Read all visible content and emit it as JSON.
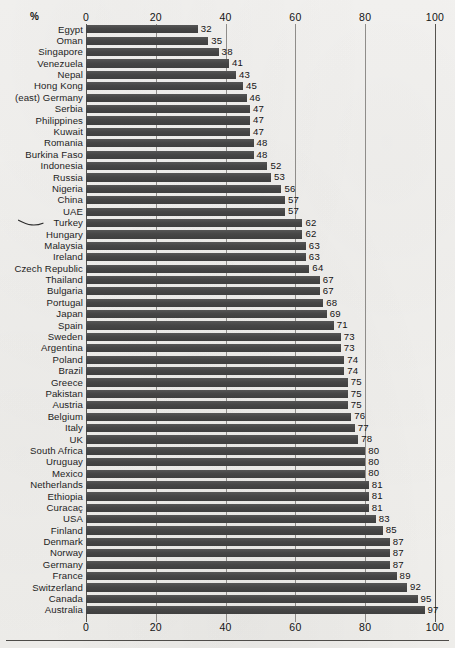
{
  "units_label": "%",
  "annotation": {
    "name": "hand-drawn-pointer",
    "target": "Turkey",
    "description": "hand-drawn squiggle pointing at the Turkey row"
  },
  "colors": {
    "bar": "#4a4a4a",
    "gridline": "#8f8d8a",
    "axis": "#55534f",
    "paper": "#f4f3f1",
    "text": "#1a1a1a"
  },
  "chart_data": {
    "type": "bar",
    "orientation": "horizontal",
    "title": "",
    "subtitle": "",
    "xlabel": "%",
    "ylabel": "",
    "xlim": [
      0,
      100
    ],
    "ticks": [
      0,
      20,
      40,
      60,
      80,
      100
    ],
    "tick_labels": [
      "0",
      "20",
      "40",
      "60",
      "80",
      "100"
    ],
    "grid": true,
    "axis_positions": [
      "top",
      "bottom"
    ],
    "legend": "none",
    "sorted": "ascending",
    "categories": [
      "Egypt",
      "Oman",
      "Singapore",
      "Venezuela",
      "Nepal",
      "Hong Kong",
      "(east) Germany",
      "Serbia",
      "Philippines",
      "Kuwait",
      "Romania",
      "Burkina Faso",
      "Indonesia",
      "Russia",
      "Nigeria",
      "China",
      "UAE",
      "Turkey",
      "Hungary",
      "Malaysia",
      "Ireland",
      "Czech Republic",
      "Thailand",
      "Bulgaria",
      "Portugal",
      "Japan",
      "Spain",
      "Sweden",
      "Argentina",
      "Poland",
      "Brazil",
      "Greece",
      "Pakistan",
      "Austria",
      "Belgium",
      "Italy",
      "UK",
      "South Africa",
      "Uruguay",
      "Mexico",
      "Netherlands",
      "Ethiopia",
      "Curacaç",
      "USA",
      "Finland",
      "Denmark",
      "Norway",
      "Germany",
      "France",
      "Switzerland",
      "Canada",
      "Australia"
    ],
    "values": [
      32,
      35,
      38,
      41,
      43,
      45,
      46,
      47,
      47,
      47,
      48,
      48,
      52,
      53,
      56,
      57,
      57,
      62,
      62,
      63,
      63,
      64,
      67,
      67,
      68,
      69,
      71,
      73,
      73,
      74,
      74,
      75,
      75,
      75,
      76,
      77,
      78,
      80,
      80,
      80,
      81,
      81,
      81,
      83,
      85,
      87,
      87,
      87,
      89,
      92,
      95,
      97
    ]
  }
}
